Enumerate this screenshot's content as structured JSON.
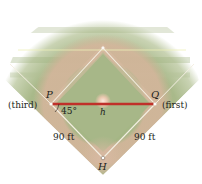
{
  "diagram": {
    "type": "baseball-diamond",
    "points": {
      "P": {
        "label": "P",
        "base": "(third)",
        "x": 51,
        "y": 104
      },
      "Q": {
        "label": "Q",
        "base": "(first)",
        "x": 155,
        "y": 104
      },
      "H": {
        "label": "H",
        "x": 103,
        "y": 158
      },
      "second": {
        "x": 103,
        "y": 48
      }
    },
    "segment_label": "h",
    "angle_label": "45°",
    "side_left_label": "90 ft",
    "side_right_label": "90 ft",
    "colors": {
      "grass": "#a9b98a",
      "grass_dark": "#98ab7a",
      "dirt": "#d8b8a0",
      "base_lines": "#f4efe2",
      "segment_PQ": "#c0302a",
      "horizon_line": "#eef0b8",
      "text": "#231f20"
    }
  }
}
